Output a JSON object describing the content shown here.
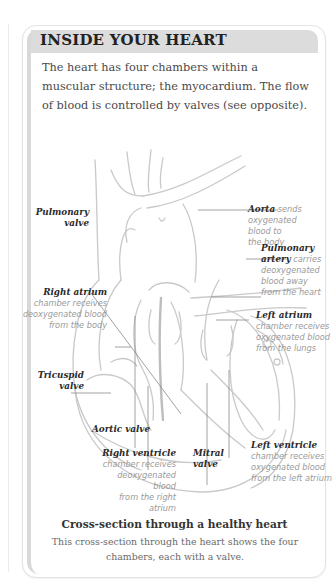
{
  "box": {
    "title": "INSIDE YOUR HEART",
    "intro": "The heart has four chambers within a muscular structure; the myocardium. The flow of blood is controlled by valves (see opposite)."
  },
  "diagram": {
    "labels": {
      "aorta": {
        "name": "Aorta",
        "desc_line1": " sends",
        "desc_rest": [
          "oxygenated",
          "blood to",
          "the body"
        ]
      },
      "pulmonary_valve": {
        "name_line1": "Pulmonary",
        "name_line2": "valve"
      },
      "pulmonary_artery": {
        "name_line1": "Pulmonary",
        "name_line2": "artery",
        "desc_line1": " carries",
        "desc_rest": [
          "deoxygenated",
          "blood away",
          "from the heart"
        ]
      },
      "right_atrium": {
        "name": "Right atrium",
        "desc": [
          "chamber receives",
          "deoxygenated blood",
          "from the body"
        ]
      },
      "left_atrium": {
        "name": "Left atrium",
        "desc": [
          "chamber receives",
          "oxygenated blood",
          "from the lungs"
        ]
      },
      "tricuspid_valve": {
        "name_line1": "Tricuspid",
        "name_line2": "valve"
      },
      "aortic_valve": {
        "name": "Aortic valve"
      },
      "right_ventricle": {
        "name": "Right ventricle",
        "desc": [
          "chamber receives",
          "deoxygenated blood",
          "from the right atrium"
        ]
      },
      "mitral_valve": {
        "name_line1": "Mitral",
        "name_line2": "valve"
      },
      "left_ventricle": {
        "name": "Left ventricle",
        "desc": [
          "chamber receives",
          "oxygenated blood",
          "from the left atrium"
        ]
      }
    }
  },
  "caption": {
    "title": "Cross-section through a healthy heart",
    "text": "This cross-section through the heart shows the four chambers, each with a valve."
  }
}
